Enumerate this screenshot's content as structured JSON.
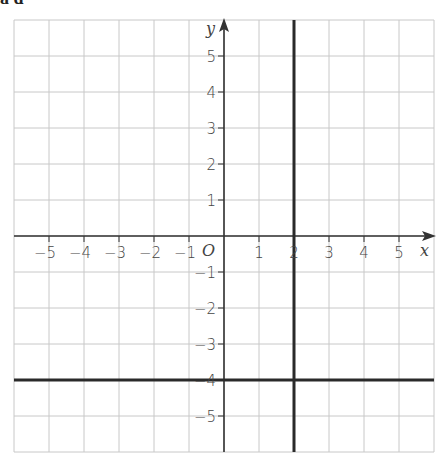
{
  "header": {
    "fragment": "a  d"
  },
  "chart_data": {
    "type": "coordinate-grid",
    "title": "",
    "xlabel": "x",
    "ylabel": "y",
    "origin_label": "O",
    "xlim": [
      -6,
      6
    ],
    "ylim": [
      -6,
      6
    ],
    "grid": true,
    "x_ticks": [
      -5,
      -4,
      -3,
      -2,
      -1,
      1,
      2,
      3,
      4,
      5
    ],
    "y_ticks": [
      5,
      4,
      3,
      2,
      1,
      -1,
      -2,
      -3,
      -4,
      -5
    ],
    "x_tick_labels": [
      "−5",
      "−4",
      "−3",
      "−2",
      "−1",
      "1",
      "2",
      "3",
      "4",
      "5"
    ],
    "y_tick_labels": [
      "5",
      "4",
      "3",
      "2",
      "1",
      "−1",
      "−2",
      "−3",
      "−4",
      "−5"
    ],
    "lines": [
      {
        "equation": "x = 2",
        "type": "vertical",
        "value": 2
      },
      {
        "equation": "y = -4",
        "type": "horizontal",
        "value": -4
      }
    ]
  },
  "colors": {
    "grid": "#c8c8c8",
    "axis": "#333333",
    "bold_line": "#2a2a2a",
    "label": "#444444"
  }
}
